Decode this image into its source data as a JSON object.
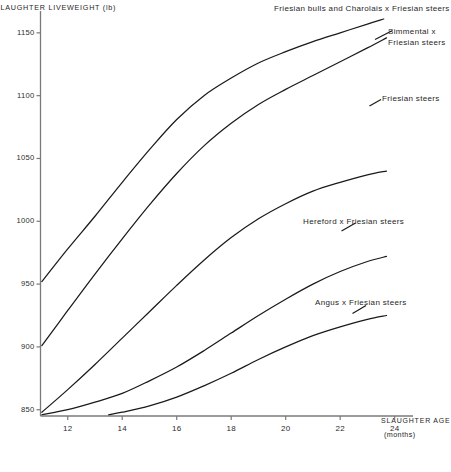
{
  "chart_data": {
    "type": "line",
    "title": "",
    "subtitle": "",
    "ylabel": "SLAUGHTER LIVEWEIGHT (lb)",
    "xlabel_line1": "SLAUGHTER AGE",
    "xlabel_line2": "(months)",
    "xlabel": "SLAUGHTER AGE (months)",
    "grid": false,
    "legend_position": "inline-annotations",
    "xlim": [
      11,
      24.6
    ],
    "ylim": [
      845,
      1165
    ],
    "xticks": [
      12,
      14,
      16,
      18,
      20,
      22,
      24
    ],
    "xticklabels": [
      "12",
      "14",
      "16",
      "18",
      "20",
      "22",
      "24"
    ],
    "yticks": [
      850,
      900,
      950,
      1000,
      1050,
      1100,
      1150
    ],
    "yticklabels": [
      "850",
      "900",
      "950",
      "1000",
      "1050",
      "1100",
      "1150"
    ],
    "series": [
      {
        "name": "Friesian bulls and Charolais x Friesian steers",
        "label_lines": [
          "Friesian bulls and Charolais x Friesian steers"
        ],
        "x": [
          11.05,
          12.0,
          13.0,
          14.0,
          15.0,
          16.0,
          17.0,
          18.0,
          19.0,
          20.0,
          21.0,
          22.0,
          23.0,
          23.6
        ],
        "y": [
          952,
          978,
          1004,
          1031,
          1057,
          1081,
          1100,
          1114,
          1126,
          1135,
          1143,
          1150,
          1157,
          1161
        ]
      },
      {
        "name": "Simmental x Friesian steers",
        "label_lines": [
          "Simmental x",
          "Friesian steers"
        ],
        "x": [
          11.05,
          12.0,
          13.0,
          14.0,
          15.0,
          16.0,
          17.0,
          18.0,
          19.0,
          20.0,
          21.0,
          22.0,
          23.0,
          23.7
        ],
        "y": [
          901,
          929,
          958,
          986,
          1013,
          1038,
          1060,
          1078,
          1093,
          1105,
          1116,
          1127,
          1138,
          1146
        ]
      },
      {
        "name": "Friesian steers",
        "label_lines": [
          "Friesian steers"
        ],
        "x": [
          11.05,
          12.0,
          13.0,
          14.0,
          15.0,
          16.0,
          17.0,
          18.0,
          19.0,
          20.0,
          21.0,
          22.0,
          23.0,
          23.7
        ],
        "y": [
          848,
          866,
          886,
          907,
          928,
          949,
          969,
          987,
          1002,
          1014,
          1024,
          1031,
          1037,
          1040
        ]
      },
      {
        "name": "Hereford x Friesian steers",
        "label_lines": [
          "Hereford x Friesian steers"
        ],
        "x": [
          11.05,
          12.0,
          13.0,
          14.0,
          15.0,
          16.0,
          17.0,
          18.0,
          19.0,
          20.0,
          21.0,
          22.0,
          23.0,
          23.7
        ],
        "y": [
          846,
          850,
          856,
          863,
          873,
          884,
          897,
          911,
          925,
          938,
          950,
          960,
          968,
          972
        ]
      },
      {
        "name": "Angus x Friesian steers",
        "label_lines": [
          "Angus x Friesian steers"
        ],
        "x": [
          13.5,
          14.0,
          15.0,
          16.0,
          17.0,
          18.0,
          19.0,
          20.0,
          21.0,
          22.0,
          23.0,
          23.7
        ],
        "y": [
          846,
          848,
          853,
          860,
          869,
          879,
          890,
          900,
          909,
          916,
          922,
          925
        ]
      }
    ],
    "annotations": [
      {
        "name": "annotation-friesian-bulls-charolais",
        "text": "Friesian bulls and Charolais x Friesian steers",
        "x_px": 274,
        "y_px": 4
      },
      {
        "name": "annotation-simmental",
        "text": "Simmental x",
        "x_px": 388,
        "y_px": 28
      },
      {
        "name": "annotation-simmental-2",
        "text": "Friesian steers",
        "x_px": 388,
        "y_px": 39
      },
      {
        "name": "annotation-friesian-steers",
        "text": "Friesian steers",
        "x_px": 382,
        "y_px": 95
      },
      {
        "name": "annotation-hereford",
        "text": "Hereford x Friesian steers",
        "x_px": 303,
        "y_px": 218
      },
      {
        "name": "annotation-angus",
        "text": "Angus x Friesian steers",
        "x_px": 315,
        "y_px": 299
      }
    ],
    "colors": {
      "line": "#1a1a1a",
      "axis": "#7a7a7a",
      "text": "#242424",
      "background": "#ffffff"
    }
  }
}
